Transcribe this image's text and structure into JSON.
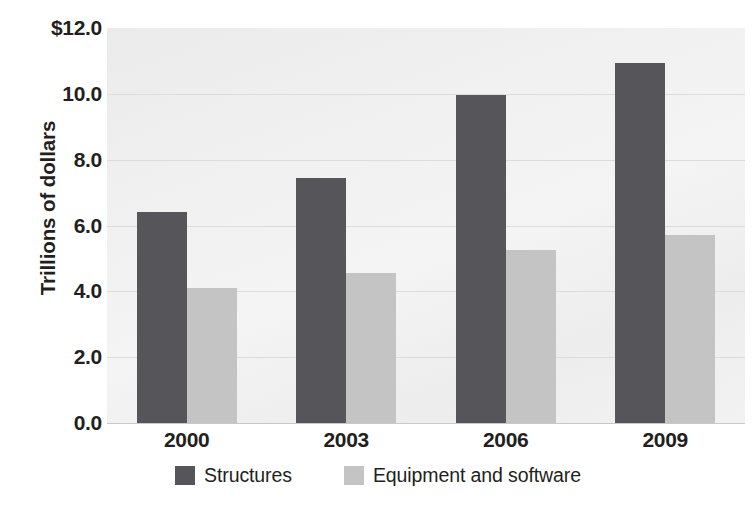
{
  "chart_data": {
    "type": "bar",
    "title": "",
    "subtitle": "",
    "xlabel": "",
    "ylabel": "Trillions of dollars",
    "categories": [
      "2000",
      "2003",
      "2006",
      "2009"
    ],
    "series": [
      {
        "name": "Structures",
        "color": "#56565a",
        "values": [
          6.4,
          7.45,
          9.95,
          10.95
        ]
      },
      {
        "name": "Equipment and software",
        "color": "#c4c4c4",
        "values": [
          4.1,
          4.55,
          5.25,
          5.7
        ]
      }
    ],
    "ylim": [
      0.0,
      12.0
    ],
    "ytick_values": [
      0.0,
      2.0,
      4.0,
      6.0,
      8.0,
      10.0,
      12.0
    ],
    "ytick_labels": [
      "0.0",
      "2.0",
      "4.0",
      "6.0",
      "8.0",
      "10.0",
      "$12.0"
    ],
    "grid": true,
    "grid_axis": "y",
    "legend_position": "bottom-center",
    "plot_background": "#f0f0f0",
    "gridline_color": "#dcdcdc"
  }
}
